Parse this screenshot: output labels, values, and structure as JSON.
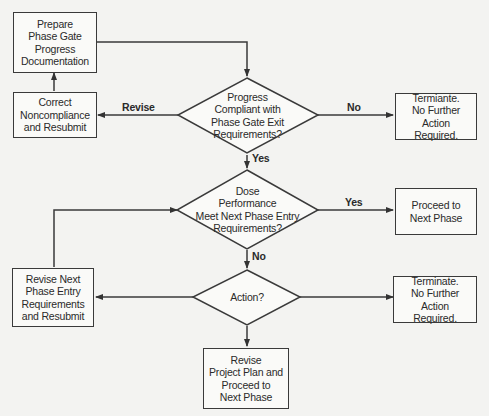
{
  "diagram": {
    "type": "flowchart",
    "nodes": {
      "prepare": {
        "shape": "process",
        "text": "Prepare\nPhase Gate\nProgress\nDocumentation"
      },
      "correct": {
        "shape": "process",
        "text": "Correct\nNoncompliance\nand Resubmit"
      },
      "decision_compliant": {
        "shape": "decision",
        "text": "Progress\nCompliant with\nPhase Gate Exit\nRequirements?"
      },
      "terminate_1": {
        "shape": "process",
        "text": "Termiante.\nNo Further Action\nRequired."
      },
      "decision_performance": {
        "shape": "decision",
        "text": "Dose\nPerformance\nMeet Next Phase Entry\nRequirements?"
      },
      "proceed": {
        "shape": "process",
        "text": "Proceed to\nNext Phase"
      },
      "revise_entry": {
        "shape": "process",
        "text": "Revise Next\nPhase Entry\nRequirements\nand Resubmit"
      },
      "decision_action": {
        "shape": "decision",
        "text": "Action?"
      },
      "terminate_2": {
        "shape": "process",
        "text": "Terminate.\nNo Further Action\nRequired."
      },
      "revise_plan": {
        "shape": "process",
        "text": "Revise\nProject Plan and\nProceed to\nNext Phase"
      }
    },
    "edges": {
      "prepare_to_compliant": {
        "from": "prepare",
        "to": "decision_compliant",
        "label": ""
      },
      "compliant_revise": {
        "from": "decision_compliant",
        "to": "correct",
        "label": "Revise"
      },
      "compliant_no": {
        "from": "decision_compliant",
        "to": "terminate_1",
        "label": "No"
      },
      "compliant_yes": {
        "from": "decision_compliant",
        "to": "decision_performance",
        "label": "Yes"
      },
      "correct_to_prepare": {
        "from": "correct",
        "to": "prepare",
        "label": ""
      },
      "performance_yes": {
        "from": "decision_performance",
        "to": "proceed",
        "label": "Yes"
      },
      "performance_no": {
        "from": "decision_performance",
        "to": "decision_action",
        "label": "No"
      },
      "action_to_revise_entry": {
        "from": "decision_action",
        "to": "revise_entry",
        "label": ""
      },
      "action_to_terminate": {
        "from": "decision_action",
        "to": "terminate_2",
        "label": ""
      },
      "action_to_revise_plan": {
        "from": "decision_action",
        "to": "revise_plan",
        "label": ""
      },
      "revise_entry_to_performance": {
        "from": "revise_entry",
        "to": "decision_performance",
        "label": ""
      }
    }
  }
}
